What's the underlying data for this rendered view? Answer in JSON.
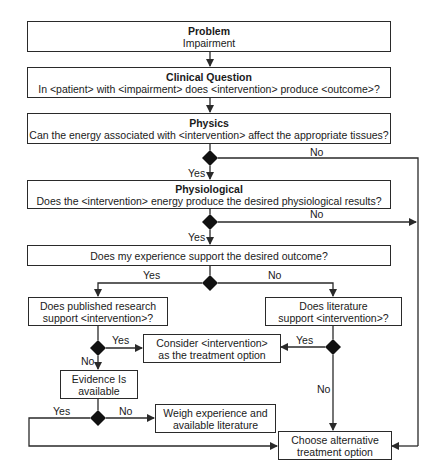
{
  "boxes": {
    "problem": {
      "title": "Problem",
      "text": "Impairment"
    },
    "clinical_question": {
      "title": "Clinical Question",
      "text": "In <patient> with <impairment> does <intervention> produce <outcome>?"
    },
    "physics": {
      "title": "Physics",
      "text": "Can the energy associated with <intervention> affect the appropriate tissues?"
    },
    "physiological": {
      "title": "Physiological",
      "text": "Does the <intervention> energy produce the desired physiological results?"
    },
    "experience": {
      "text": "Does my experience support the desired outcome?"
    },
    "published_research": {
      "line1": "Does published research",
      "line2": "support <intervention>?"
    },
    "literature": {
      "line1": "Does literature",
      "line2": "support <intervention>?"
    },
    "consider": {
      "line1": "Consider <intervention>",
      "line2": "as the treatment option"
    },
    "evidence": {
      "line1": "Evidence Is",
      "line2": "available"
    },
    "weigh": {
      "line1": "Weigh experience and",
      "line2": "available literature"
    },
    "choose_alternative": {
      "line1": "Choose alternative",
      "line2": "treatment option"
    }
  },
  "labels": {
    "physics_no": "No",
    "physics_yes": "Yes",
    "physiological_no": "No",
    "physiological_yes": "Yes",
    "experience_yes": "Yes",
    "experience_no": "No",
    "research_yes": "Yes",
    "research_no": "No",
    "literature_yes": "Yes",
    "literature_no": "No",
    "evidence_yes": "Yes",
    "evidence_no": "No"
  },
  "colors": {
    "line": "#2a2a2a",
    "diamond": "#111111",
    "background": "#ffffff"
  }
}
